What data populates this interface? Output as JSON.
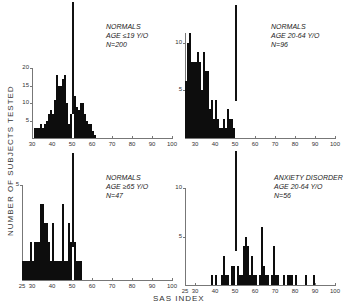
{
  "figure": {
    "ylabel": "NUMBER OF SUBJECTS TESTED",
    "xlabel": "SAS INDEX"
  },
  "panels": [
    {
      "id": "tl",
      "annotation": [
        "NORMALS",
        "AGE ≤19 Y/O",
        "N=200"
      ]
    },
    {
      "id": "tr",
      "annotation": [
        "NORMALS",
        "AGE 20-64 Y/O",
        "N=96"
      ]
    },
    {
      "id": "bl",
      "annotation": [
        "NORMALS",
        "AGE ≥65 Y/O",
        "N=47"
      ]
    },
    {
      "id": "br",
      "annotation": [
        "ANXIETY DISORDER",
        "AGE 20-64 Y/O",
        "N=56"
      ]
    }
  ],
  "chart_data": [
    {
      "type": "bar",
      "title": "NORMALS AGE ≤19 Y/O N=200",
      "xlabel": "SAS INDEX",
      "ylabel": "NUMBER OF SUBJECTS TESTED",
      "xlim": [
        25,
        100
      ],
      "ylim": [
        0,
        20
      ],
      "xticks": [
        30,
        40,
        50,
        60,
        70,
        80,
        90,
        100
      ],
      "yticks": [
        5,
        10,
        15,
        20
      ],
      "reference_line_x": 50,
      "x": [
        31,
        32,
        33,
        34,
        35,
        36,
        37,
        38,
        39,
        40,
        41,
        42,
        43,
        44,
        45,
        46,
        47,
        48,
        49,
        50,
        51,
        52,
        53,
        54,
        55,
        56,
        57,
        58,
        59,
        60,
        61
      ],
      "values": [
        3,
        3,
        3,
        4,
        3,
        4,
        5,
        7,
        8,
        7,
        11,
        18,
        15,
        15,
        17,
        18,
        10,
        4,
        7,
        7,
        12,
        9,
        8,
        10,
        10,
        7,
        5,
        4,
        4,
        2,
        1
      ]
    },
    {
      "type": "bar",
      "title": "NORMALS AGE 20-64 Y/O N=96",
      "xlabel": "SAS INDEX",
      "ylabel": "NUMBER OF SUBJECTS TESTED",
      "xlim": [
        25,
        100
      ],
      "ylim": [
        0,
        11
      ],
      "xticks": [
        30,
        40,
        50,
        60,
        70,
        80,
        90,
        100
      ],
      "yticks": [
        5,
        10
      ],
      "reference_line_x": 50,
      "x": [
        25,
        26,
        27,
        28,
        29,
        30,
        31,
        32,
        33,
        34,
        35,
        36,
        37,
        38,
        39,
        40,
        41,
        42,
        43,
        44,
        45,
        46,
        47,
        48,
        49
      ],
      "values": [
        6,
        10,
        11,
        8,
        8,
        8,
        9,
        8,
        5,
        9,
        7,
        7,
        3,
        4,
        2,
        4,
        2,
        1,
        1,
        2,
        1,
        3,
        2,
        2,
        1
      ]
    },
    {
      "type": "bar",
      "title": "NORMALS AGE ≥65 Y/O N=47",
      "xlabel": "SAS INDEX",
      "ylabel": "NUMBER OF SUBJECTS TESTED",
      "xlim": [
        25,
        100
      ],
      "ylim": [
        0,
        5
      ],
      "xticks": [
        25,
        30,
        40,
        50,
        60,
        70,
        80,
        90,
        100
      ],
      "yticks": [
        5
      ],
      "reference_line_x": 50,
      "x": [
        25,
        26,
        27,
        28,
        29,
        30,
        31,
        32,
        33,
        34,
        35,
        36,
        37,
        38,
        39,
        40,
        41,
        42,
        43,
        44,
        45,
        46,
        47,
        48,
        49,
        50,
        51,
        52,
        53,
        54
      ],
      "values": [
        1,
        1,
        1,
        1,
        2,
        1,
        2,
        2,
        2,
        4,
        4,
        3,
        3,
        2,
        1,
        3,
        1,
        1,
        1,
        1,
        4,
        1,
        1,
        3,
        2,
        4,
        2,
        1,
        1,
        1
      ]
    },
    {
      "type": "bar",
      "title": "ANXIETY DISORDER AGE 20-64 Y/O N=56",
      "xlabel": "SAS INDEX",
      "ylabel": "NUMBER OF SUBJECTS TESTED",
      "xlim": [
        25,
        100
      ],
      "ylim": [
        0,
        10
      ],
      "xticks": [
        25,
        30,
        40,
        50,
        60,
        70,
        80,
        90,
        100
      ],
      "yticks": [
        5,
        10
      ],
      "reference_line_x": 50,
      "x": [
        38,
        40,
        43,
        44,
        45,
        46,
        48,
        49,
        50,
        51,
        52,
        53,
        54,
        55,
        56,
        57,
        58,
        59,
        60,
        62,
        63,
        64,
        65,
        66,
        68,
        69,
        70,
        71,
        74,
        76,
        77,
        78,
        80,
        85,
        89
      ],
      "values": [
        1,
        1,
        1,
        3,
        1,
        1,
        2,
        2,
        1,
        2,
        1,
        1,
        4,
        5,
        4,
        1,
        3,
        1,
        1,
        1,
        6,
        2,
        1,
        1,
        1,
        4,
        1,
        1,
        1,
        1,
        1,
        1,
        1,
        1,
        1
      ]
    }
  ]
}
